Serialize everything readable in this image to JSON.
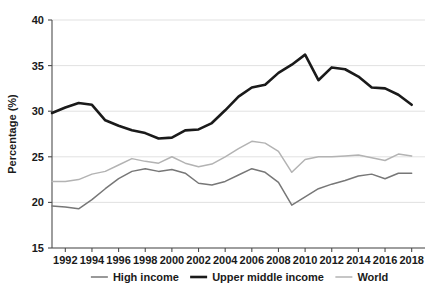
{
  "chart_data": {
    "type": "line",
    "title": "",
    "subtitle": "",
    "xlabel": "",
    "ylabel": "Percentage (%)",
    "xlim": [
      1991,
      2019
    ],
    "ylim": [
      15,
      40
    ],
    "ytick_labels": [
      "40",
      "35",
      "30",
      "25",
      "20",
      "15"
    ],
    "yticks": [
      40,
      35,
      30,
      25,
      20,
      15
    ],
    "xtick_labels": [
      "1992",
      "1994",
      "1996",
      "1998",
      "2000",
      "2002",
      "2004",
      "2006",
      "2008",
      "2010",
      "2012",
      "2014",
      "2016",
      "2018"
    ],
    "xticks": [
      1992,
      1994,
      1996,
      1998,
      2000,
      2002,
      2004,
      2006,
      2008,
      2010,
      2012,
      2014,
      2016,
      2018
    ],
    "grid": true,
    "grid_axis": "y",
    "legend_position": "bottom",
    "x": [
      1991,
      1992,
      1993,
      1994,
      1995,
      1996,
      1997,
      1998,
      1999,
      2000,
      2001,
      2002,
      2003,
      2004,
      2005,
      2006,
      2007,
      2008,
      2009,
      2010,
      2011,
      2012,
      2013,
      2014,
      2015,
      2016,
      2017,
      2018
    ],
    "series": [
      {
        "name": "High income",
        "color": "#777777",
        "width": 1.5,
        "values": [
          19.6,
          19.5,
          19.3,
          20.3,
          21.5,
          22.6,
          23.4,
          23.7,
          23.4,
          23.6,
          23.2,
          22.1,
          21.9,
          22.3,
          23.0,
          23.7,
          23.3,
          22.2,
          19.7,
          20.6,
          21.5,
          22.0,
          22.4,
          22.9,
          23.1,
          22.6,
          23.2,
          23.2
        ]
      },
      {
        "name": "Upper middle income",
        "color": "#1a1a1a",
        "width": 2.6,
        "values": [
          29.8,
          30.4,
          30.9,
          30.7,
          29.0,
          28.4,
          27.9,
          27.6,
          27.0,
          27.1,
          27.9,
          28.0,
          28.7,
          30.1,
          31.6,
          32.6,
          32.9,
          34.2,
          35.1,
          36.2,
          33.4,
          34.8,
          34.6,
          33.8,
          32.6,
          32.5,
          31.8,
          30.7
        ]
      },
      {
        "name": "World",
        "color": "#b3b3b3",
        "width": 1.5,
        "values": [
          22.3,
          22.3,
          22.5,
          23.1,
          23.4,
          24.1,
          24.8,
          24.5,
          24.3,
          25.0,
          24.3,
          23.9,
          24.2,
          25.0,
          25.9,
          26.7,
          26.5,
          25.6,
          23.3,
          24.7,
          25.0,
          25.0,
          25.1,
          25.2,
          24.9,
          24.6,
          25.3,
          25.1
        ]
      }
    ],
    "series_reindexed_note": ""
  },
  "legend": {
    "items": [
      {
        "label": "High income"
      },
      {
        "label": "Upper middle income"
      },
      {
        "label": "World"
      }
    ]
  },
  "axes": {
    "y_title": "Percentage (%)"
  }
}
